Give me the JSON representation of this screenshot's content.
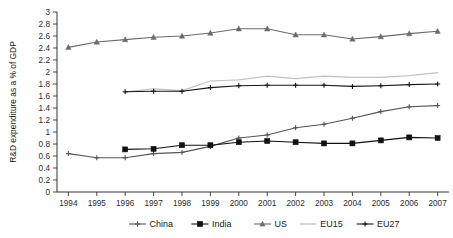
{
  "chart_data": {
    "type": "line",
    "title": "",
    "xlabel": "",
    "ylabel": "R&D expenditure as a % of GDP",
    "x": [
      1994,
      1995,
      1996,
      1997,
      1998,
      1999,
      2000,
      2001,
      2002,
      2003,
      2004,
      2005,
      2006,
      2007
    ],
    "categories": [
      "1994",
      "1995",
      "1996",
      "1997",
      "1998",
      "1999",
      "2000",
      "2001",
      "2002",
      "2003",
      "2004",
      "2005",
      "2006",
      "2007"
    ],
    "xlim": [
      1993.6,
      2007.4
    ],
    "ylim": [
      0,
      3
    ],
    "yticks": [
      0,
      0.2,
      0.4,
      0.6,
      0.8,
      1,
      1.2,
      1.4,
      1.6,
      1.8,
      2,
      2.2,
      2.4,
      2.6,
      2.8,
      3
    ],
    "ytick_labels": [
      "0",
      "0.2",
      "0.4",
      "0.6",
      "0.8",
      "1",
      "1.2",
      "1.4",
      "1.6",
      "1.8",
      "2",
      "2.2",
      "2.4",
      "2.6",
      "2.8",
      "3"
    ],
    "grid": false,
    "legend_position": "bottom",
    "series": [
      {
        "name": "China",
        "color": "#555555",
        "marker": "plus",
        "values": [
          0.64,
          0.57,
          0.57,
          0.64,
          0.66,
          0.76,
          0.9,
          0.95,
          1.07,
          1.13,
          1.23,
          1.34,
          1.42,
          1.44
        ]
      },
      {
        "name": "India",
        "color": "#111111",
        "marker": "square",
        "values": [
          null,
          null,
          0.71,
          0.72,
          0.78,
          0.78,
          0.83,
          0.85,
          0.83,
          0.81,
          0.81,
          0.86,
          0.91,
          0.9
        ]
      },
      {
        "name": "US",
        "color": "#6b6b6b",
        "marker": "triangle",
        "values": [
          2.41,
          2.5,
          2.54,
          2.58,
          2.6,
          2.65,
          2.72,
          2.72,
          2.62,
          2.62,
          2.55,
          2.59,
          2.64,
          2.68
        ]
      },
      {
        "name": "EU15",
        "color": "#c2c2c2",
        "marker": "none",
        "values": [
          null,
          null,
          1.67,
          1.72,
          1.69,
          1.85,
          1.87,
          1.93,
          1.89,
          1.93,
          1.91,
          1.91,
          1.94,
          1.99
        ]
      },
      {
        "name": "EU27",
        "color": "#161616",
        "marker": "plus",
        "values": [
          null,
          null,
          1.67,
          1.68,
          1.68,
          1.74,
          1.77,
          1.78,
          1.78,
          1.78,
          1.76,
          1.77,
          1.79,
          1.8
        ]
      }
    ]
  },
  "legend": {
    "items": [
      {
        "label": "China"
      },
      {
        "label": "India"
      },
      {
        "label": "US"
      },
      {
        "label": "EU15"
      },
      {
        "label": "EU27"
      }
    ]
  }
}
